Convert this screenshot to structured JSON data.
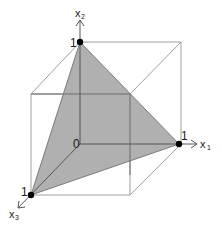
{
  "diagram": {
    "colors": {
      "cube_edge": "#9a9a9a",
      "axis": "#555555",
      "triangle_fill": "#a8a8a8",
      "triangle_edge": "#777777",
      "point": "#000000"
    },
    "origin_label": "0",
    "axes": [
      {
        "name": "x1",
        "label_main": "x",
        "label_sub": "1",
        "tick_label": "1"
      },
      {
        "name": "x2",
        "label_main": "x",
        "label_sub": "2",
        "tick_label": "1"
      },
      {
        "name": "x3",
        "label_main": "x",
        "label_sub": "3",
        "tick_label": "1"
      }
    ]
  }
}
